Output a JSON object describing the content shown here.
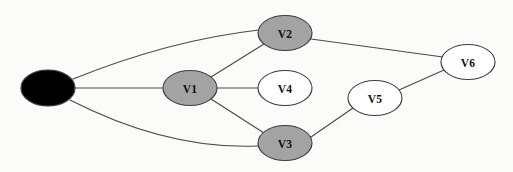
{
  "diagram": {
    "background_color": "#fbfbfa",
    "edge_color": "#4a4a4a",
    "node_stroke_color": "#3d3d3d",
    "fill_colors": {
      "source": "#000000",
      "shaded": "#a3a3a3",
      "unshaded": "#ffffff"
    },
    "node_size": {
      "rx": 27,
      "ry": 17.5
    },
    "nodes": [
      {
        "id": "source",
        "label": "",
        "cx": 48,
        "cy": 88,
        "rx": 27,
        "ry": 18,
        "fill": "#000000",
        "label_color": "#ffffff",
        "state": "filled"
      },
      {
        "id": "v1",
        "label": "V1",
        "cx": 190,
        "cy": 88,
        "rx": 27,
        "ry": 17.5,
        "fill": "#a3a3a3",
        "label_color": "#111111",
        "state": "shaded"
      },
      {
        "id": "v2",
        "label": "V2",
        "cx": 285,
        "cy": 33,
        "rx": 27,
        "ry": 17.5,
        "fill": "#a3a3a3",
        "label_color": "#111111",
        "state": "shaded"
      },
      {
        "id": "v4",
        "label": "V4",
        "cx": 285,
        "cy": 88,
        "rx": 27,
        "ry": 17.5,
        "fill": "#ffffff",
        "label_color": "#111111",
        "state": "unshaded"
      },
      {
        "id": "v3",
        "label": "V3",
        "cx": 285,
        "cy": 143,
        "rx": 27,
        "ry": 17.5,
        "fill": "#a3a3a3",
        "label_color": "#111111",
        "state": "shaded"
      },
      {
        "id": "v5",
        "label": "V5",
        "cx": 375,
        "cy": 98,
        "rx": 27,
        "ry": 17.5,
        "fill": "#ffffff",
        "label_color": "#111111",
        "state": "unshaded"
      },
      {
        "id": "v6",
        "label": "V6",
        "cx": 468,
        "cy": 62,
        "rx": 27,
        "ry": 17.5,
        "fill": "#ffffff",
        "label_color": "#111111",
        "state": "unshaded"
      }
    ],
    "edges": [
      {
        "id": "source-v2",
        "from": "source",
        "to": "v2",
        "shape": "curve",
        "path": "M 73 79 Q 170 40 259 30"
      },
      {
        "id": "source-v1",
        "from": "source",
        "to": "v1",
        "shape": "line",
        "path": "M 75 88 L 163 88"
      },
      {
        "id": "source-v3",
        "from": "source",
        "to": "v3",
        "shape": "curve",
        "path": "M 70 100 Q 168 150 258 146"
      },
      {
        "id": "v1-v2",
        "from": "v1",
        "to": "v2",
        "shape": "line",
        "path": "M 211 77 L 264 44"
      },
      {
        "id": "v1-v4",
        "from": "v1",
        "to": "v4",
        "shape": "line",
        "path": "M 217 88 L 258 88"
      },
      {
        "id": "v1-v3",
        "from": "v1",
        "to": "v3",
        "shape": "line",
        "path": "M 211 99 L 264 133"
      },
      {
        "id": "v2-v6",
        "from": "v2",
        "to": "v6",
        "shape": "line",
        "path": "M 311 39 L 443 57"
      },
      {
        "id": "v3-v5",
        "from": "v3",
        "to": "v5",
        "shape": "line",
        "path": "M 311 137 L 353 108"
      },
      {
        "id": "v5-v6",
        "from": "v5",
        "to": "v6",
        "shape": "line",
        "path": "M 399 90 L 444 70"
      }
    ]
  }
}
